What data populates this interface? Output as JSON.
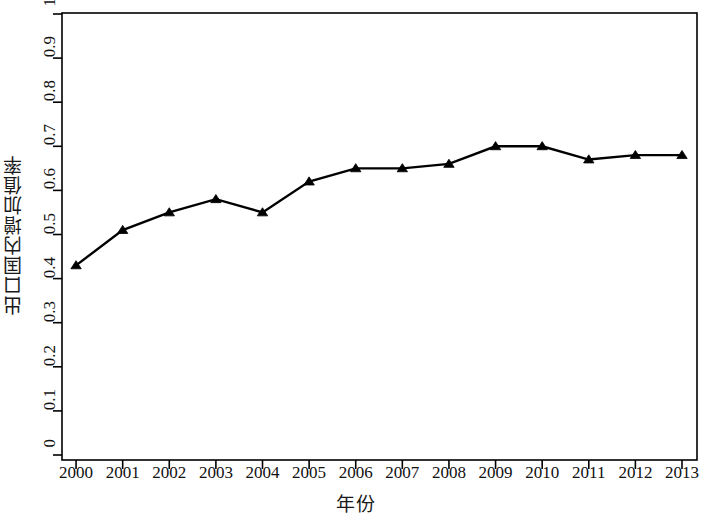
{
  "chart_data": {
    "type": "line",
    "title": "",
    "subtitle": "",
    "xlabel": "年份",
    "ylabel": "出口国内增加值率",
    "categories": [
      "2000",
      "2001",
      "2002",
      "2003",
      "2004",
      "2005",
      "2006",
      "2007",
      "2008",
      "2009",
      "2010",
      "2011",
      "2012",
      "2013"
    ],
    "x": [
      2000,
      2001,
      2002,
      2003,
      2004,
      2005,
      2006,
      2007,
      2008,
      2009,
      2010,
      2011,
      2012,
      2013
    ],
    "series": [
      {
        "name": "出口国内增加值率",
        "values": [
          0.43,
          0.51,
          0.55,
          0.58,
          0.55,
          0.62,
          0.65,
          0.65,
          0.66,
          0.7,
          0.7,
          0.67,
          0.68,
          0.68
        ],
        "color": "#000000",
        "marker": "triangle-up",
        "line_width": 2.4
      }
    ],
    "ylim": [
      0,
      1
    ],
    "yticks": [
      0,
      0.1,
      0.2,
      0.3,
      0.4,
      0.5,
      0.6,
      0.7,
      0.8,
      0.9,
      1
    ],
    "ytick_labels": [
      "0",
      "0.1",
      "0.2",
      "0.3",
      "0.4",
      "0.5",
      "0.6",
      "0.7",
      "0.8",
      "0.9",
      "1"
    ],
    "xtick_labels": [
      "2000",
      "2001",
      "2002",
      "2003",
      "2004",
      "2005",
      "2006",
      "2007",
      "2008",
      "2009",
      "2010",
      "2011",
      "2012",
      "2013"
    ],
    "grid": false,
    "legend": false,
    "legend_position": "none",
    "background_color": "#ffffff",
    "axis_color": "#000000",
    "plot_box": true
  },
  "axes": {
    "y_title": "出口国内增加值率",
    "x_title": "年份"
  }
}
